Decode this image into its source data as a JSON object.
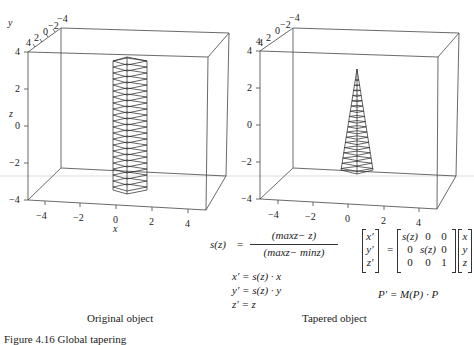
{
  "figures": [
    {
      "id": "original",
      "caption": "Original object",
      "axes": {
        "x_label": "x",
        "y_label": "y",
        "z_label": "z",
        "x_ticks": [
          "−4",
          "−2",
          "0",
          "2",
          "4"
        ],
        "y_ticks": [
          "4",
          "2",
          "0",
          "−2",
          "−4"
        ],
        "z_ticks": [
          "4",
          "2",
          "0",
          "−2",
          "−4"
        ]
      },
      "object": "uniform prism (column) of stacked hexagonal rings"
    },
    {
      "id": "tapered",
      "caption": "Tapered object",
      "axes": {
        "x_ticks": [
          "−4",
          "−2",
          "0",
          "2",
          "4"
        ],
        "y_ticks": [
          "4",
          "2",
          "0",
          "−2",
          "−4"
        ],
        "z_ticks": [
          "4",
          "2",
          "0",
          "−2",
          "−4"
        ]
      },
      "object": "tapered pyramid narrowing toward the top"
    }
  ],
  "equations": {
    "s_lhs": "s(z)",
    "equals": "=",
    "s_numerator": "(maxz− z)",
    "s_denominator": "(maxz− minz)",
    "x_eq": "x′ = s(z) · x",
    "y_eq": "y′ = s(z) · y",
    "z_eq": "z′ = z",
    "matrix_lhs": [
      "x′",
      "y′",
      "z′"
    ],
    "matrix": [
      [
        "s(z)",
        "0",
        "0"
      ],
      [
        "0",
        "s(z)",
        "0"
      ],
      [
        "0",
        "0",
        "1"
      ]
    ],
    "matrix_rhs": [
      "x",
      "y",
      "z"
    ],
    "p_eq": "P′ = M(P) · P"
  },
  "figure_caption": "Figure 4.16   Global tapering"
}
